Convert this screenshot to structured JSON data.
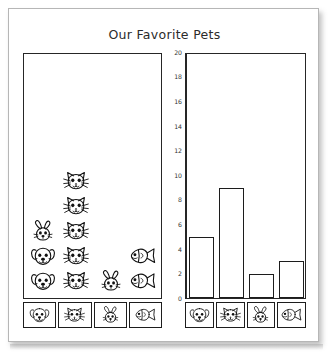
{
  "title": "Our Favorite Pets",
  "chart_data": {
    "type": "bar",
    "title": "Our Favorite Pets",
    "xlabel": "",
    "ylabel": "",
    "categories": [
      "dog",
      "cat",
      "rabbit",
      "fish"
    ],
    "category_icons": [
      "dog-icon",
      "cat-icon",
      "rabbit-icon",
      "fish-icon"
    ],
    "values": [
      5,
      9,
      2,
      3
    ],
    "ylim": [
      0,
      20
    ],
    "yticks": [
      0,
      2,
      4,
      6,
      8,
      10,
      12,
      14,
      16,
      18,
      20
    ],
    "ytick_labels": [
      "0",
      "2",
      "4",
      "6",
      "8",
      "10",
      "12",
      "14",
      "16",
      "18",
      "20"
    ],
    "grid": false,
    "legend_position": "bottom",
    "bar_fill": "#ffffff",
    "bar_stroke": "#1c1c1c",
    "pictograph": {
      "type": "pictograph",
      "note": "Left panel repeats one icon per unit of a partial tally",
      "columns": [
        {
          "category": "dog",
          "icon": "dog-icon",
          "count": 2
        },
        {
          "category": "cat",
          "icon": "cat-icon",
          "count": 5
        },
        {
          "category": "rabbit",
          "icon": "rabbit-icon",
          "count": 1
        },
        {
          "category": "fish",
          "icon": "fish-icon",
          "count": 2
        }
      ],
      "stray_icons": [
        {
          "icon": "rabbit-icon",
          "column": "dog",
          "row": 3
        }
      ]
    }
  },
  "picto_panel": {
    "name": "pictograph",
    "icons": [
      {
        "icon": "cat-icon",
        "col": 1,
        "row": 5
      },
      {
        "icon": "cat-icon",
        "col": 1,
        "row": 4
      },
      {
        "icon": "cat-icon",
        "col": 1,
        "row": 3
      },
      {
        "icon": "cat-icon",
        "col": 1,
        "row": 2
      },
      {
        "icon": "cat-icon",
        "col": 1,
        "row": 1
      },
      {
        "icon": "rabbit-icon",
        "col": 0,
        "row": 3
      },
      {
        "icon": "dog-icon",
        "col": 0,
        "row": 2
      },
      {
        "icon": "dog-icon",
        "col": 0,
        "row": 1
      },
      {
        "icon": "fish-icon",
        "col": 3,
        "row": 2
      },
      {
        "icon": "fish-icon",
        "col": 3,
        "row": 1
      },
      {
        "icon": "rabbit-icon",
        "col": 2,
        "row": 1
      }
    ]
  },
  "legend": {
    "name": "pet-legend",
    "items": [
      {
        "icon": "dog-icon",
        "label": "dog"
      },
      {
        "icon": "cat-icon",
        "label": "cat"
      },
      {
        "icon": "rabbit-icon",
        "label": "rabbit"
      },
      {
        "icon": "fish-icon",
        "label": "fish"
      }
    ]
  },
  "colors": {
    "paper": "#ffffff",
    "frame": "#262626",
    "ink": "#1c1c1c",
    "page_border": "#b6b6b6"
  }
}
